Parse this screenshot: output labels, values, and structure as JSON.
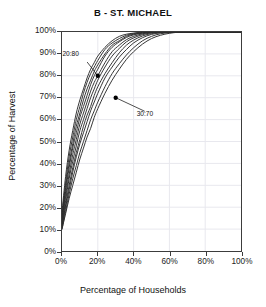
{
  "chart_data": {
    "type": "line",
    "title": "B - ST. MICHAEL",
    "xlabel": "Percentage of Households",
    "ylabel": "Percentage of Harvest",
    "xlim": [
      0,
      100
    ],
    "ylim": [
      0,
      100
    ],
    "xticks": [
      "0%",
      "20%",
      "40%",
      "60%",
      "80%",
      "100%"
    ],
    "xtick_values": [
      0,
      20,
      40,
      60,
      80,
      100
    ],
    "yticks": [
      "0%",
      "10%",
      "20%",
      "30%",
      "40%",
      "50%",
      "60%",
      "70%",
      "80%",
      "90%",
      "100%"
    ],
    "ytick_values": [
      0,
      10,
      20,
      30,
      40,
      50,
      60,
      70,
      80,
      90,
      100
    ],
    "grid": true,
    "legend": "none",
    "x": [
      0,
      2,
      4,
      6,
      8,
      10,
      12,
      14,
      16,
      18,
      20,
      24,
      28,
      32,
      36,
      40,
      45,
      50,
      55,
      60,
      65,
      70,
      80,
      90,
      100
    ],
    "series": [
      {
        "name": "curve-1",
        "values": [
          18,
          34,
          46,
          55,
          63,
          69,
          74,
          79,
          83,
          86,
          89,
          93,
          96,
          98,
          99,
          99.5,
          100,
          100,
          100,
          100,
          100,
          100,
          100,
          100,
          100
        ]
      },
      {
        "name": "curve-2",
        "values": [
          16,
          31,
          43,
          52,
          60,
          66,
          72,
          77,
          81,
          84,
          87,
          92,
          95,
          97,
          98.5,
          99.3,
          99.8,
          100,
          100,
          100,
          100,
          100,
          100,
          100,
          100
        ]
      },
      {
        "name": "curve-3",
        "values": [
          15,
          29,
          40,
          49,
          57,
          63,
          69,
          74,
          78,
          82,
          85,
          90,
          94,
          96,
          98,
          99,
          99.6,
          100,
          100,
          100,
          100,
          100,
          100,
          100,
          100
        ]
      },
      {
        "name": "curve-4",
        "values": [
          14,
          27,
          38,
          47,
          54,
          61,
          66,
          71,
          76,
          80,
          83,
          89,
          93,
          95.5,
          97.5,
          98.7,
          99.5,
          99.9,
          100,
          100,
          100,
          100,
          100,
          100,
          100
        ]
      },
      {
        "name": "curve-5",
        "values": [
          13,
          25,
          35,
          44,
          51,
          58,
          63,
          68,
          73,
          77,
          80,
          86,
          91,
          94,
          96.5,
          98,
          99.2,
          99.8,
          100,
          100,
          100,
          100,
          100,
          100,
          100
        ]
      },
      {
        "name": "curve-6",
        "values": [
          12,
          23,
          33,
          41,
          48,
          55,
          60,
          65,
          70,
          74,
          78,
          84,
          89,
          92.5,
          95.5,
          97.3,
          98.8,
          99.6,
          99.9,
          100,
          100,
          100,
          100,
          100,
          100
        ]
      },
      {
        "name": "curve-7",
        "values": [
          11,
          21,
          30,
          38,
          45,
          51,
          57,
          62,
          66,
          71,
          75,
          81,
          86,
          90.5,
          94,
          96.3,
          98.2,
          99.3,
          99.8,
          100,
          100,
          100,
          100,
          100,
          100
        ]
      },
      {
        "name": "curve-8",
        "values": [
          11,
          20,
          28,
          36,
          43,
          49,
          54,
          59,
          64,
          68,
          72,
          79,
          84,
          88.5,
          92,
          95,
          97.4,
          98.9,
          99.6,
          99.9,
          100,
          100,
          100,
          100,
          100
        ]
      },
      {
        "name": "curve-9",
        "values": [
          10,
          18,
          26,
          33,
          39,
          45,
          50,
          55,
          60,
          64,
          68,
          75,
          81,
          85.5,
          89.5,
          92.8,
          96,
          98,
          99.2,
          99.7,
          100,
          100,
          100,
          100,
          100
        ]
      },
      {
        "name": "curve-10",
        "values": [
          10,
          17,
          24,
          30,
          36,
          42,
          47,
          52,
          56,
          61,
          65,
          72,
          78,
          83,
          87.5,
          91,
          94.5,
          97,
          98.5,
          99.4,
          99.9,
          100,
          100,
          100,
          100
        ]
      }
    ],
    "annotations": [
      {
        "label": "20:80",
        "point_x": 20,
        "point_y": 80,
        "label_x": 3,
        "label_y": 89
      },
      {
        "label": "30:70",
        "point_x": 30,
        "point_y": 70,
        "label_x": 44,
        "label_y": 62
      }
    ],
    "colors": {
      "curve": "#2b2b2b",
      "axis": "#3c3c3c",
      "grid": "#e8e8ee",
      "text": "#111111",
      "marker": "#000000"
    }
  }
}
